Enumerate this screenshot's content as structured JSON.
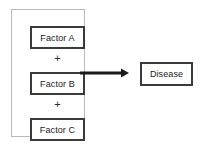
{
  "diagram": {
    "type": "flow-diagram",
    "canvas": {
      "width": 221,
      "height": 147,
      "background": "#ffffff"
    },
    "colors": {
      "box_border": "#3a3a3a",
      "group_border": "#b9b9b9",
      "arrow": "#1a1a1a",
      "text": "#1a1a1a",
      "background": "#ffffff"
    },
    "factor_group": {
      "label": "",
      "factors": [
        {
          "id": "factor-a",
          "label": "Factor A"
        },
        {
          "id": "factor-b",
          "label": "Factor B"
        },
        {
          "id": "factor-c",
          "label": "Factor C"
        }
      ],
      "operators": [
        {
          "id": "plus-a-b",
          "symbol": "+"
        },
        {
          "id": "plus-b-c",
          "symbol": "+"
        }
      ]
    },
    "connector": {
      "id": "arrow-to-disease",
      "icon": "arrow-right-icon",
      "direction": "right",
      "from": "factor-b",
      "to": "disease"
    },
    "outcome": {
      "id": "disease",
      "label": "Disease"
    }
  }
}
